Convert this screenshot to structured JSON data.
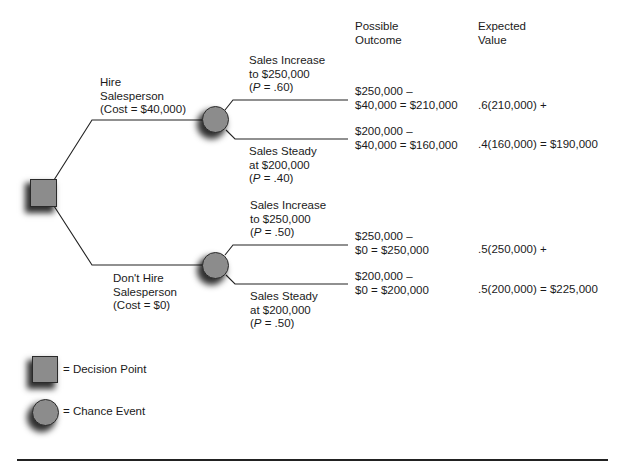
{
  "header": {
    "possible_outcome": [
      "Possible",
      "Outcome"
    ],
    "expected_value": [
      "Expected",
      "Value"
    ]
  },
  "hire": {
    "label": [
      "Hire",
      "Salesperson",
      "(Cost = $40,000)"
    ],
    "increase": {
      "event": [
        "Sales Increase",
        "to $250,000"
      ],
      "prob": {
        "open": "(",
        "var": "P",
        "rest": " = .60)"
      },
      "possible_outcome": [
        "$250,000 –",
        "$40,000 = $210,000"
      ],
      "expected_value": ".6(210,000) +"
    },
    "steady": {
      "event": [
        "Sales Steady",
        "at $200,000"
      ],
      "prob": {
        "open": "(",
        "var": "P",
        "rest": " = .40)"
      },
      "possible_outcome": [
        "$200,000 –",
        "$40,000 = $160,000"
      ],
      "expected_value": ".4(160,000) = $190,000"
    }
  },
  "no_hire": {
    "label": [
      "Don't Hire",
      "Salesperson",
      "(Cost = $0)"
    ],
    "increase": {
      "event": [
        "Sales Increase",
        "to $250,000"
      ],
      "prob": {
        "open": "(",
        "var": "P",
        "rest": " = .50)"
      },
      "possible_outcome": [
        "$250,000 –",
        "$0 = $250,000"
      ],
      "expected_value": ".5(250,000) +"
    },
    "steady": {
      "event": [
        "Sales Steady",
        "at $200,000"
      ],
      "prob": {
        "open": "(",
        "var": "P",
        "rest": " = .50)"
      },
      "possible_outcome": [
        "$200,000 –",
        "$0 = $200,000"
      ],
      "expected_value": ".5(200,000) = $225,000"
    }
  },
  "legend": {
    "decision_point": "= Decision Point",
    "chance_event": "= Chance Event"
  },
  "colors": {
    "node_fill": "#8c8c8c",
    "node_border": "#2a2a2a",
    "line": "#222222"
  }
}
